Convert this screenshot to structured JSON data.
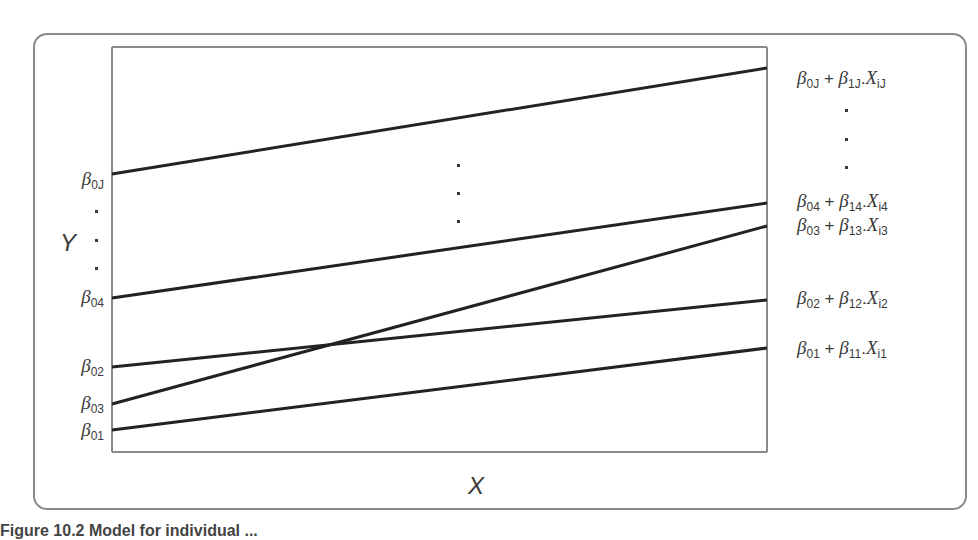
{
  "diagram": {
    "type": "multilevel-regression-lines",
    "y_axis_label": "Y",
    "x_axis_label": "X",
    "left_intercept_labels": [
      {
        "id": "b0J",
        "beta": "β",
        "sub": "0J",
        "y": 181
      },
      {
        "id": "b04",
        "beta": "β",
        "sub": "04",
        "y": 299
      },
      {
        "id": "b02",
        "beta": "β",
        "sub": "02",
        "y": 368
      },
      {
        "id": "b03",
        "beta": "β",
        "sub": "03",
        "y": 405
      },
      {
        "id": "b01",
        "beta": "β",
        "sub": "01",
        "y": 432
      }
    ],
    "right_equation_labels": [
      {
        "id": "eqJ",
        "b0": "0J",
        "b1": "1J",
        "x": "iJ",
        "text": "β0J + β1J.XiJ",
        "y": 80
      },
      {
        "id": "eq4",
        "b0": "04",
        "b1": "14",
        "x": "i4",
        "text": "β04 + β14.Xi4",
        "y": 203
      },
      {
        "id": "eq3",
        "b0": "03",
        "b1": "13",
        "x": "i3",
        "text": "β03 + β13.Xi3",
        "y": 227
      },
      {
        "id": "eq2",
        "b0": "02",
        "b1": "12",
        "x": "i2",
        "text": "β02 + β12.Xi2",
        "y": 300
      },
      {
        "id": "eq1",
        "b0": "01",
        "b1": "11",
        "x": "i1",
        "text": "β01 + β11.Xi1",
        "y": 350
      }
    ],
    "plus": "+",
    "dot_sep": ".",
    "lines": [
      {
        "id": "J",
        "x1": 112,
        "y1": 174,
        "x2": 767,
        "y2": 68
      },
      {
        "id": "4",
        "x1": 112,
        "y1": 298,
        "x2": 767,
        "y2": 203
      },
      {
        "id": "3",
        "x1": 112,
        "y1": 404,
        "x2": 767,
        "y2": 226
      },
      {
        "id": "2",
        "x1": 112,
        "y1": 367,
        "x2": 767,
        "y2": 300
      },
      {
        "id": "1",
        "x1": 112,
        "y1": 430,
        "x2": 767,
        "y2": 348
      }
    ],
    "colors": {
      "line": "#222222",
      "axis": "#8a8a8a",
      "text": "#3a3a3a"
    }
  },
  "caption": {
    "text": "Figure 10.2  Model for individual ..."
  }
}
